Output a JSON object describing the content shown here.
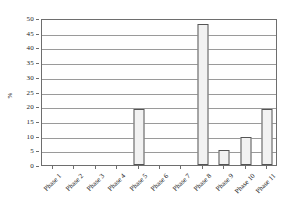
{
  "chart_data": {
    "type": "bar",
    "title": "",
    "xlabel": "",
    "ylabel": "%",
    "ylim": [
      0,
      50
    ],
    "ytick_step": 5,
    "yticks": [
      0,
      5,
      10,
      15,
      20,
      25,
      30,
      35,
      40,
      45,
      50
    ],
    "ytick_labels": [
      "0",
      "5",
      "10",
      "15",
      "20",
      "25",
      "30",
      "35",
      "40",
      "45",
      "50"
    ],
    "grid": true,
    "grid_axis": "y",
    "legend": false,
    "legend_position": "none",
    "categories": [
      "Phase 1",
      "Phase 2",
      "Phase 3",
      "Phase 4",
      "Phase 5",
      "Phase 6",
      "Phase 7",
      "Phase 8",
      "Phase 9",
      "Phase 10",
      "Phase 11"
    ],
    "values": [
      0,
      0,
      0,
      0,
      19,
      0,
      0,
      48,
      5,
      9.5,
      19
    ],
    "bar_fill_color": "#f2f2f2",
    "bar_edge_color": "#555555",
    "gridline_color": "#9a9a9a",
    "axis_color": "#6e6e6e",
    "background_color": "#ffffff",
    "xtick_label_rotation": -45
  }
}
